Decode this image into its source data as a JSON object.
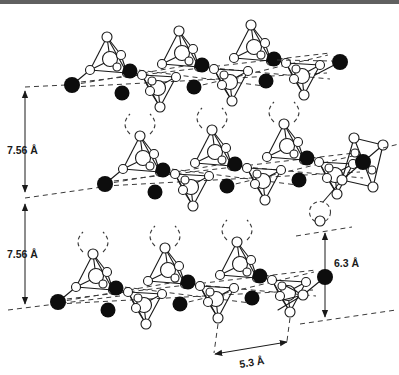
{
  "figure": {
    "annotations": {
      "left_upper": {
        "label": "7.56 Å"
      },
      "left_lower": {
        "label": "7.56 Å"
      },
      "right": {
        "label": "6.3 Å"
      },
      "bottom": {
        "label": "5.3 Å"
      }
    },
    "icons": {
      "filled_circle": "filled-atom-icon",
      "open_circle": "open-atom-icon",
      "tetrahedron_up": "tetrahedron-up-icon",
      "tetrahedron_down": "tetrahedron-down-icon",
      "octahedron": "octahedron-icon",
      "interface_arc": "dashed-arc-icon"
    },
    "colors": {
      "line": "#1a1a1a",
      "dashed": "#3a3a3a",
      "atom_filled": "#0d0d0d",
      "atom_open": "#ffffff",
      "background": "#ffffff",
      "top_rule": "#606060"
    }
  }
}
